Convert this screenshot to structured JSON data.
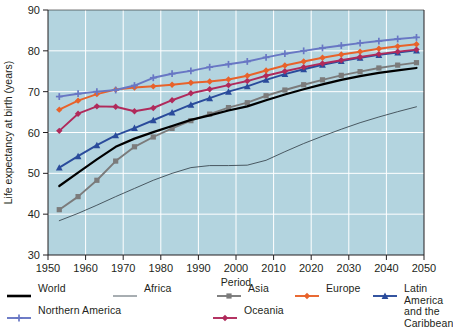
{
  "chart_data": {
    "type": "line",
    "title": "",
    "xlabel": "Period",
    "ylabel": "Life expectancy at birth (years)",
    "xlim": [
      1950,
      2050
    ],
    "ylim": [
      30,
      90
    ],
    "xticks": [
      "1950",
      "1960",
      "1970",
      "1980",
      "1990",
      "2000",
      "2010",
      "2020",
      "2030",
      "2040",
      "2050"
    ],
    "yticks": [
      "30",
      "40",
      "50",
      "60",
      "70",
      "80",
      "90"
    ],
    "grid": true,
    "legend_position": "bottom",
    "plot_background": "#b3d4df",
    "x": [
      1953,
      1958,
      1963,
      1968,
      1973,
      1978,
      1983,
      1988,
      1993,
      1998,
      2003,
      2008,
      2013,
      2018,
      2023,
      2028,
      2033,
      2038,
      2043,
      2048
    ],
    "series": [
      {
        "name": "World",
        "color": "#000000",
        "marker": "none",
        "width": 2.2,
        "values": [
          46.9,
          50.2,
          53.4,
          56.5,
          58.5,
          60.1,
          61.6,
          63.1,
          64.2,
          65.4,
          66.4,
          67.9,
          69.3,
          70.6,
          71.8,
          72.9,
          73.8,
          74.6,
          75.2,
          75.8
        ]
      },
      {
        "name": "Africa",
        "color": "#3c4a52",
        "marker": "none",
        "width": 0.9,
        "values": [
          38.4,
          40.2,
          42.2,
          44.3,
          46.3,
          48.3,
          50.0,
          51.4,
          51.9,
          51.9,
          52.0,
          53.2,
          55.3,
          57.3,
          59.1,
          60.8,
          62.4,
          63.8,
          65.1,
          66.3
        ]
      },
      {
        "name": "Asia",
        "color": "#7b7b7b",
        "marker": "square",
        "width": 1.9,
        "values": [
          41.1,
          44.3,
          48.3,
          53.0,
          56.5,
          58.9,
          61.0,
          62.9,
          64.5,
          66.1,
          67.3,
          69.0,
          70.4,
          71.7,
          72.9,
          74.0,
          74.9,
          75.8,
          76.5,
          77.1
        ]
      },
      {
        "name": "Europe",
        "color": "#e8622a",
        "marker": "diamond",
        "width": 2.0,
        "values": [
          65.6,
          67.8,
          69.4,
          70.5,
          71.0,
          71.3,
          71.7,
          72.2,
          72.5,
          73.0,
          73.9,
          75.2,
          76.4,
          77.4,
          78.3,
          79.1,
          79.8,
          80.5,
          81.1,
          81.6
        ]
      },
      {
        "name": "Latin America and the Caribbean",
        "color": "#2a4b9b",
        "marker": "triangle",
        "width": 1.9,
        "values": [
          51.4,
          54.2,
          56.9,
          59.3,
          61.1,
          63.0,
          64.9,
          66.8,
          68.4,
          70.0,
          71.3,
          72.9,
          74.3,
          75.5,
          76.6,
          77.5,
          78.3,
          79.0,
          79.6,
          80.1
        ]
      },
      {
        "name": "Northern America",
        "color": "#6877c4",
        "marker": "plus",
        "width": 1.9,
        "values": [
          68.8,
          69.5,
          70.0,
          70.4,
          71.5,
          73.4,
          74.4,
          75.1,
          76.0,
          76.7,
          77.4,
          78.4,
          79.3,
          80.0,
          80.7,
          81.3,
          81.9,
          82.4,
          82.9,
          83.3
        ]
      },
      {
        "name": "Oceania",
        "color": "#b02a5b",
        "marker": "diamond",
        "width": 1.9,
        "values": [
          60.4,
          64.6,
          66.4,
          66.3,
          65.2,
          66.0,
          67.9,
          69.6,
          70.6,
          71.6,
          72.6,
          73.9,
          75.0,
          76.0,
          76.9,
          77.7,
          78.5,
          79.2,
          79.8,
          80.3
        ]
      }
    ]
  },
  "legend": {
    "rows": [
      [
        {
          "label": "World",
          "series": "World",
          "key": "line"
        },
        {
          "label": "Africa",
          "series": "Africa",
          "key": "thin-line"
        },
        {
          "label": "Asia",
          "series": "Asia",
          "key": "line-square"
        },
        {
          "label": "Europe",
          "series": "Europe",
          "key": "line-diamond"
        },
        {
          "label": "Latin America\nand the Caribbean",
          "series": "Latin America and the Caribbean",
          "key": "line-triangle"
        }
      ],
      [
        {
          "label": "Northern America",
          "series": "Northern America",
          "key": "line-plus"
        },
        {
          "label": "Oceania",
          "series": "Oceania",
          "key": "line-diamond"
        }
      ]
    ]
  }
}
